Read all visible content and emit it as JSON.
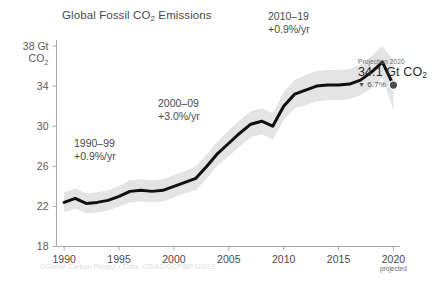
{
  "chart_data": {
    "type": "line",
    "title": "Global Fossil CO2 Emissions",
    "title_pre": "Global Fossil CO",
    "title_sub": "2",
    "title_post": " Emissions",
    "xlabel": "",
    "ylabel": "38 Gt CO2",
    "ylabel_line1": "38 Gt",
    "ylabel_line2": "CO",
    "ylabel_line2_sub": "2",
    "xlim": [
      1989.3,
      2020.6
    ],
    "ylim": [
      18,
      38.6
    ],
    "yticks": [
      38,
      34,
      30,
      26,
      22,
      18
    ],
    "ytick_labels": [
      "38 Gt",
      "34",
      "30",
      "26",
      "22",
      "18"
    ],
    "xticks": [
      1990,
      1995,
      2000,
      2005,
      2010,
      2015,
      2020
    ],
    "xtick_labels": [
      "1990",
      "1995",
      "2000",
      "2005",
      "2010",
      "2015",
      "2020"
    ],
    "xtick_sublabel_2020": "projected",
    "grid": false,
    "legend": "none",
    "series": [
      {
        "name": "Global fossil CO2 emissions",
        "x": [
          1990,
          1991,
          1992,
          1993,
          1994,
          1995,
          1996,
          1997,
          1998,
          1999,
          2000,
          2001,
          2002,
          2003,
          2004,
          2005,
          2006,
          2007,
          2008,
          2009,
          2010,
          2011,
          2012,
          2013,
          2014,
          2015,
          2016,
          2017,
          2018,
          2019,
          2020
        ],
        "values": [
          22.4,
          22.8,
          22.3,
          22.4,
          22.6,
          23.0,
          23.5,
          23.6,
          23.5,
          23.6,
          24.0,
          24.4,
          24.8,
          26.0,
          27.3,
          28.3,
          29.3,
          30.2,
          30.5,
          30.0,
          32.0,
          33.2,
          33.6,
          34.0,
          34.1,
          34.1,
          34.2,
          34.6,
          35.4,
          36.4,
          34.1
        ]
      }
    ],
    "uncertainty_band": {
      "name": "uncertainty range",
      "lower": [
        21.4,
        21.8,
        21.3,
        21.4,
        21.6,
        22.0,
        22.4,
        22.5,
        22.4,
        22.5,
        22.9,
        23.3,
        23.6,
        24.8,
        26.1,
        27.0,
        28.0,
        28.9,
        29.2,
        28.7,
        30.6,
        31.8,
        32.1,
        32.5,
        32.6,
        32.6,
        32.7,
        33.1,
        33.8,
        34.8,
        31.6
      ],
      "upper": [
        23.4,
        23.8,
        23.3,
        23.4,
        23.6,
        24.0,
        24.6,
        24.7,
        24.6,
        24.7,
        25.1,
        25.5,
        26.0,
        27.2,
        28.5,
        29.6,
        30.6,
        31.5,
        31.8,
        31.3,
        33.4,
        34.6,
        35.1,
        35.5,
        35.6,
        35.6,
        35.7,
        36.1,
        37.0,
        38.0,
        36.6
      ]
    },
    "annotations": [
      {
        "id": "period-1990-1999",
        "line1": "1990–99",
        "line2": "+0.9%/yr"
      },
      {
        "id": "period-2000-2009",
        "line1": "2000–09",
        "line2": "+3.0%/yr"
      },
      {
        "id": "period-2010-2019",
        "line1": "2010–19",
        "line2": "+0.9%/yr"
      }
    ],
    "projection": {
      "label": "Projection 2020",
      "value": "34.1 Gt CO",
      "value_sub": "2",
      "delta_arrow": "▼",
      "delta": "6.7%",
      "marker_year": 2020,
      "marker_value": 34.1
    },
    "colors": {
      "line": "#111111",
      "band": "#e2e2e2",
      "axis": "#9a9a9a",
      "text": "#4a4a4a",
      "background": "#ffffff",
      "credit": "#dcdcdc"
    }
  },
  "credit": {
    "text": "©Global Carbon Project  •  Data: CDIAC/GCP/BP/USGS"
  }
}
